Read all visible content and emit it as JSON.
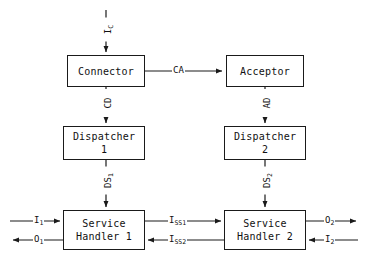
{
  "diagram": {
    "type": "block-diagram",
    "colors": {
      "stroke": "#1a1a1a",
      "text": "#111111",
      "background": "#ffffff"
    },
    "nodes": [
      {
        "id": "connector",
        "label_line1": "Connector",
        "label_line2": "",
        "x": 67,
        "y": 55,
        "w": 78,
        "h": 32
      },
      {
        "id": "acceptor",
        "label_line1": "Acceptor",
        "label_line2": "",
        "x": 226,
        "y": 55,
        "w": 78,
        "h": 32
      },
      {
        "id": "dispatcher-1",
        "label_line1": "Dispatcher",
        "label_line2": "1",
        "x": 63,
        "y": 126,
        "w": 82,
        "h": 34
      },
      {
        "id": "dispatcher-2",
        "label_line1": "Dispatcher",
        "label_line2": "2",
        "x": 224,
        "y": 126,
        "w": 82,
        "h": 34
      },
      {
        "id": "service-handler-1",
        "label_line1": "Service",
        "label_line2": "Handler 1",
        "x": 63,
        "y": 210,
        "w": 82,
        "h": 40
      },
      {
        "id": "service-handler-2",
        "label_line1": "Service",
        "label_line2": "Handler 2",
        "x": 224,
        "y": 210,
        "w": 82,
        "h": 40
      }
    ],
    "edge_labels": {
      "input_c": {
        "text": "I",
        "sub": "C",
        "orientation": "vertical"
      },
      "cd": {
        "text": "CD",
        "sub": "",
        "orientation": "vertical"
      },
      "ad": {
        "text": "AD",
        "sub": "",
        "orientation": "vertical"
      },
      "ds1": {
        "text": "DS",
        "sub": "1",
        "orientation": "vertical"
      },
      "ds2": {
        "text": "DS",
        "sub": "2",
        "orientation": "vertical"
      },
      "ca": {
        "text": "CA",
        "sub": "",
        "orientation": "horizontal"
      },
      "iss1": {
        "text": "I",
        "sub": "SS1",
        "orientation": "horizontal"
      },
      "iss2": {
        "text": "I",
        "sub": "SS2",
        "orientation": "horizontal"
      }
    },
    "io_labels": {
      "i1": {
        "text": "I",
        "sub": "1",
        "direction": "in",
        "side": "left"
      },
      "o1": {
        "text": "O",
        "sub": "1",
        "direction": "out",
        "side": "left"
      },
      "o2": {
        "text": "O",
        "sub": "2",
        "direction": "out",
        "side": "right"
      },
      "i2": {
        "text": "I",
        "sub": "2",
        "direction": "in",
        "side": "right"
      }
    }
  }
}
